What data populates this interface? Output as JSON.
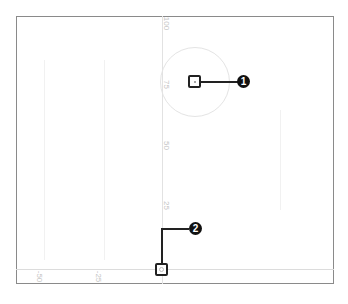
{
  "diagram": {
    "type": "coordinate-plane-callout",
    "y_axis": {
      "ticks": [
        "100",
        "75",
        "50",
        "25"
      ]
    },
    "x_axis": {
      "ticks": [
        "-50",
        "-25"
      ]
    },
    "callouts": [
      {
        "number": "1",
        "target": "point-in-circle"
      },
      {
        "number": "2",
        "target": "origin"
      }
    ]
  }
}
